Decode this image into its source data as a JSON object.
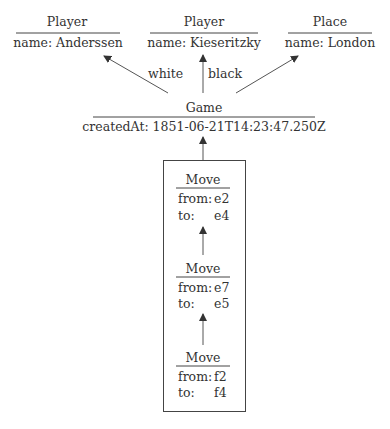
{
  "nodes": {
    "player_white": {
      "type": "Player",
      "attr": "name: Anderssen"
    },
    "player_black": {
      "type": "Player",
      "attr": "name: Kieseritzky"
    },
    "place": {
      "type": "Place",
      "attr": "name: London"
    },
    "game": {
      "type": "Game",
      "attr": "createdAt: 1851-06-21T14:23:47.250Z"
    },
    "moves": [
      {
        "type": "Move",
        "from_label": "from:",
        "from": "e2",
        "to_label": "to:",
        "to": "e4"
      },
      {
        "type": "Move",
        "from_label": "from:",
        "from": "e7",
        "to_label": "to:",
        "to": "e5"
      },
      {
        "type": "Move",
        "from_label": "from:",
        "from": "f2",
        "to_label": "to:",
        "to": "f4"
      }
    ]
  },
  "edges": {
    "white": "white",
    "black": "black"
  },
  "colors": {
    "line": "#444444",
    "text": "#333333"
  }
}
